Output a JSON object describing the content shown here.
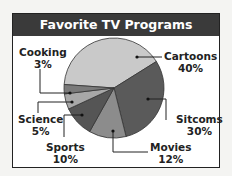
{
  "chart_data": {
    "type": "pie",
    "title": "Favorite TV Programs",
    "categories": [
      "Cartoons",
      "Sitcoms",
      "Movies",
      "Sports",
      "Science",
      "Cooking"
    ],
    "values": [
      40,
      30,
      12,
      10,
      5,
      3
    ],
    "labels": [
      "Cartoons 40%",
      "Sitcoms 30%",
      "Movies 12%",
      "Sports 10%",
      "Science 5%",
      "Cooking 3%"
    ],
    "colors": [
      "#c9c9c9",
      "#5a5a5a",
      "#8c8c8c",
      "#555555",
      "#a8a8a8",
      "#7a7a7a"
    ]
  },
  "labels": {
    "cartoons": {
      "name": "Cartoons",
      "pct": "40%"
    },
    "sitcoms": {
      "name": "Sitcoms",
      "pct": "30%"
    },
    "movies": {
      "name": "Movies",
      "pct": "12%"
    },
    "sports": {
      "name": "Sports",
      "pct": "10%"
    },
    "science": {
      "name": "Science",
      "pct": "5%"
    },
    "cooking": {
      "name": "Cooking",
      "pct": "3%"
    }
  }
}
